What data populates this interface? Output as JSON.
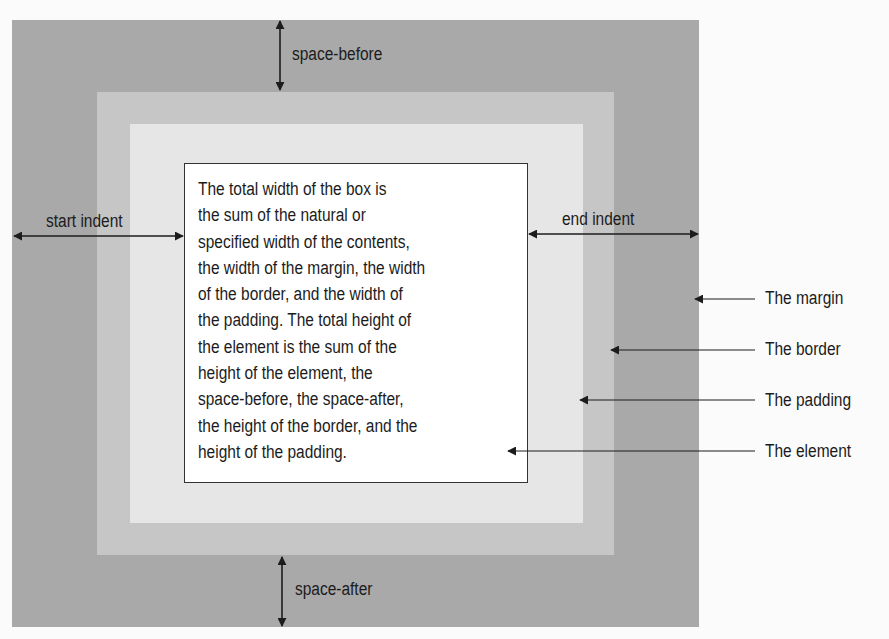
{
  "diagram": {
    "labels": {
      "space_before": "space-before",
      "space_after": "space-after",
      "start_indent": "start indent",
      "end_indent": "end indent"
    },
    "callouts": [
      {
        "label": "The margin"
      },
      {
        "label": "The border"
      },
      {
        "label": "The padding"
      },
      {
        "label": "The element"
      }
    ],
    "element_text_lines": [
      "The total width of the box is",
      "the sum of the natural or",
      "specified width of the contents,",
      "the width of the margin, the width",
      "of the border, and the width of",
      "the padding. The total height of",
      "the element is the sum of the",
      "height of the element, the",
      "space-before, the space-after,",
      "the height of the border, and the",
      "height of the padding."
    ],
    "colors": {
      "margin": "#a9a9a9",
      "border": "#c6c6c6",
      "padding": "#e6e6e6",
      "element": "#ffffff",
      "ink": "#1c1c1c"
    }
  }
}
